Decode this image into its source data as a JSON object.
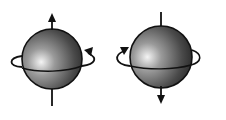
{
  "diagram": {
    "title": "",
    "colors": {
      "background": "#ffffff",
      "stroke": "#111111",
      "sphere_highlight": "#f2f2f2",
      "sphere_mid": "#8a8a8a",
      "sphere_dark": "#2a2a2a"
    },
    "spheres": [
      {
        "name": "spin-up-sphere",
        "cx": 52,
        "cy": 59,
        "r": 30,
        "axis_arrow": "up",
        "rotation_arrow_side": "right"
      },
      {
        "name": "spin-down-sphere",
        "cx": 161,
        "cy": 57,
        "r": 31,
        "axis_arrow": "down",
        "rotation_arrow_side": "left"
      }
    ]
  }
}
